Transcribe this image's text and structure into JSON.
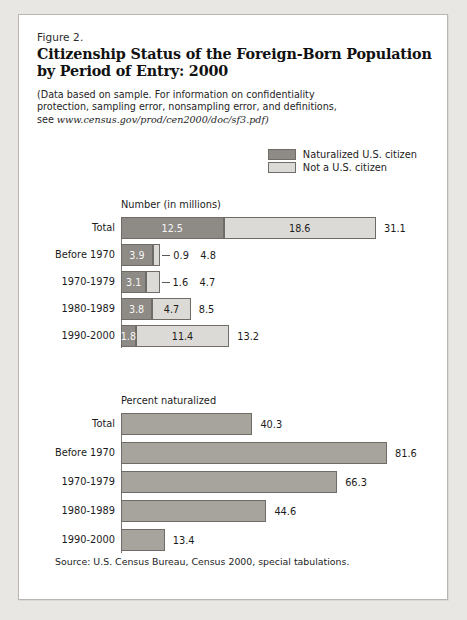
{
  "figure": {
    "number": "Figure 2.",
    "title_line1": "Citizenship Status of the Foreign-Born Population",
    "title_line2": "by Period of Entry: 2000",
    "subtitle_line1": "(Data based on sample.  For information on confidentiality",
    "subtitle_line2": "protection, sampling error, nonsampling error, and definitions,",
    "subtitle_line3_prefix": "see ",
    "subtitle_url": "www.census.gov/prod/cen2000/doc/sf3.pdf)",
    "source": "Source: U.S. Census Bureau, Census 2000, special tabulations."
  },
  "legend": {
    "items": [
      {
        "label": "Naturalized U.S. citizen",
        "color": "#8e8a85"
      },
      {
        "label": "Not a U.S. citizen",
        "color": "#dcdad6"
      }
    ]
  },
  "colors": {
    "dark": "#8e8a85",
    "light": "#dcdad6",
    "solo": "#a7a39d",
    "outline": "#6f6c67",
    "page_background": "#e9e7e3",
    "card_background": "#ffffff"
  },
  "chart_data": [
    {
      "type": "bar",
      "orientation": "horizontal",
      "stacked": true,
      "title": "Number (in millions)",
      "xlabel": "",
      "ylabel": "",
      "xlim": [
        0,
        31.1
      ],
      "grid": false,
      "legend_position": "top-right",
      "categories": [
        "Total",
        "Before 1970",
        "1970-1979",
        "1980-1989",
        "1990-2000"
      ],
      "series": [
        {
          "name": "Naturalized U.S. citizen",
          "values": [
            12.5,
            3.9,
            3.1,
            3.8,
            1.8
          ]
        },
        {
          "name": "Not a U.S. citizen",
          "values": [
            18.6,
            0.9,
            1.6,
            4.7,
            11.4
          ]
        }
      ],
      "totals": [
        31.1,
        4.8,
        4.7,
        8.5,
        13.2
      ],
      "rows": [
        {
          "category": "Total",
          "dark": "12.5",
          "light": "18.6",
          "total": "31.1",
          "dark_val": 12.5,
          "light_val": 18.6,
          "total_val": 31.1,
          "light_outside": false
        },
        {
          "category": "Before 1970",
          "dark": "3.9",
          "light": "0.9",
          "total": "4.8",
          "dark_val": 3.9,
          "light_val": 0.9,
          "total_val": 4.8,
          "light_outside": true
        },
        {
          "category": "1970-1979",
          "dark": "3.1",
          "light": "1.6",
          "total": "4.7",
          "dark_val": 3.1,
          "light_val": 1.6,
          "total_val": 4.7,
          "light_outside": true
        },
        {
          "category": "1980-1989",
          "dark": "3.8",
          "light": "4.7",
          "total": "8.5",
          "dark_val": 3.8,
          "light_val": 4.7,
          "total_val": 8.5,
          "light_outside": false
        },
        {
          "category": "1990-2000",
          "dark": "1.8",
          "light": "11.4",
          "total": "13.2",
          "dark_val": 1.8,
          "light_val": 11.4,
          "total_val": 13.2,
          "light_outside": false
        }
      ]
    },
    {
      "type": "bar",
      "orientation": "horizontal",
      "stacked": false,
      "title": "Percent naturalized",
      "xlabel": "",
      "ylabel": "",
      "xlim": [
        0,
        81.6
      ],
      "grid": false,
      "categories": [
        "Total",
        "Before 1970",
        "1970-1979",
        "1980-1989",
        "1990-2000"
      ],
      "values": [
        40.3,
        81.6,
        66.3,
        44.6,
        13.4
      ],
      "rows": [
        {
          "category": "Total",
          "value": "40.3",
          "value_num": 40.3
        },
        {
          "category": "Before 1970",
          "value": "81.6",
          "value_num": 81.6
        },
        {
          "category": "1970-1979",
          "value": "66.3",
          "value_num": 66.3
        },
        {
          "category": "1980-1989",
          "value": "44.6",
          "value_num": 44.6
        },
        {
          "category": "1990-2000",
          "value": "13.4",
          "value_num": 13.4
        }
      ]
    }
  ]
}
